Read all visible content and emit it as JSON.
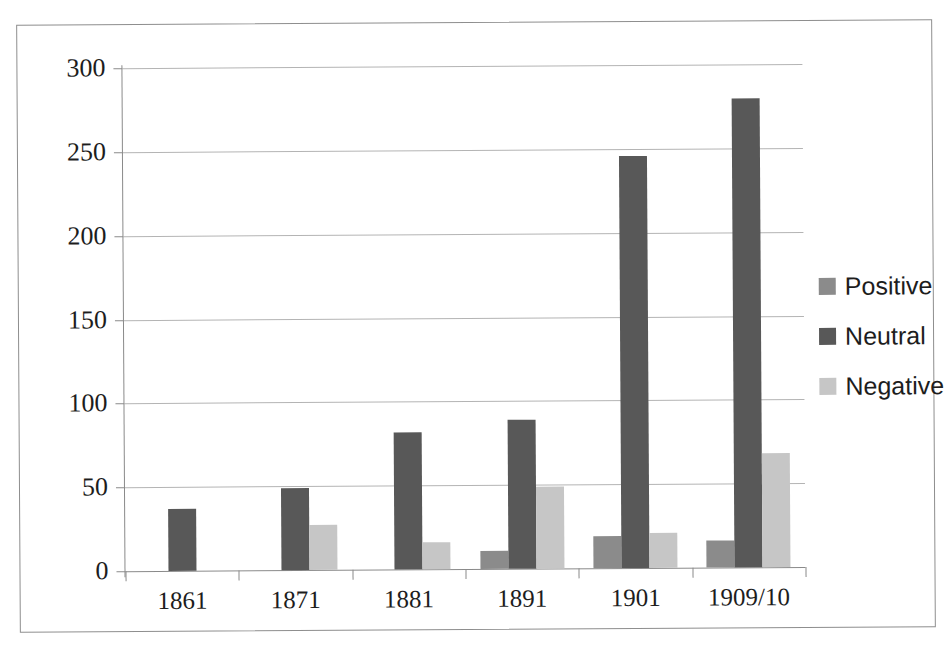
{
  "chart_data": {
    "type": "bar",
    "title": "",
    "subtitle": "",
    "xlabel": "",
    "ylabel": "",
    "categories": [
      "1861",
      "1871",
      "1881",
      "1891",
      "1901",
      "1909/10"
    ],
    "series": [
      {
        "name": "Positive",
        "color": "#8b8b8b",
        "values": [
          0,
          0,
          0,
          11,
          19,
          16
        ]
      },
      {
        "name": "Neutral",
        "color": "#585858",
        "values": [
          37,
          49,
          82,
          89,
          246,
          280
        ]
      },
      {
        "name": "Negative",
        "color": "#c6c6c6",
        "values": [
          0,
          27,
          16,
          49,
          21,
          68
        ]
      }
    ],
    "ylim": [
      0,
      300
    ],
    "ytick_values": [
      0,
      50,
      100,
      150,
      200,
      250,
      300
    ],
    "ytick_labels": [
      "0",
      "50",
      "100",
      "150",
      "200",
      "250",
      "300"
    ],
    "grid": true,
    "grid_axis": "y",
    "legend_position": "right",
    "legend_entries": [
      "Positive",
      "Neutral",
      "Negative"
    ],
    "annotations": []
  },
  "figure": {
    "border_color": "#8e8e8e",
    "background": "#ffffff",
    "gridline_color": "#b4b4b4",
    "axis_color": "#8a8a8a",
    "text_color": "#1d1d1d"
  }
}
